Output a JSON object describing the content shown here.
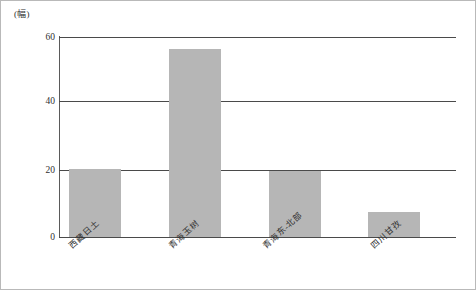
{
  "unit_label": "(幅)",
  "colors": {
    "bar_fill": "#b6b6b6",
    "gridline": "#4a4a4a",
    "frame": "#b9b9b9",
    "text": "#2f2f2f"
  },
  "axis": {
    "y_ticks": [
      "0",
      "20",
      "40",
      "60"
    ],
    "y_tick_values": [
      0,
      20,
      40,
      60
    ]
  },
  "chart_data": {
    "type": "bar",
    "title": "",
    "subtitle": "",
    "xlabel": "",
    "ylabel": "(幅)",
    "categories": [
      "西藏日土",
      "青海玉树",
      "青海东-北部",
      "四川甘孜"
    ],
    "values": [
      20.5,
      56.5,
      19.8,
      7.5
    ],
    "ylim": [
      0,
      60
    ],
    "yticks": [
      0,
      20,
      40,
      60
    ],
    "grid": true,
    "legend": false,
    "legend_position": "none",
    "bar_color": "#b6b6b6",
    "tick_label_rotation": -42
  }
}
